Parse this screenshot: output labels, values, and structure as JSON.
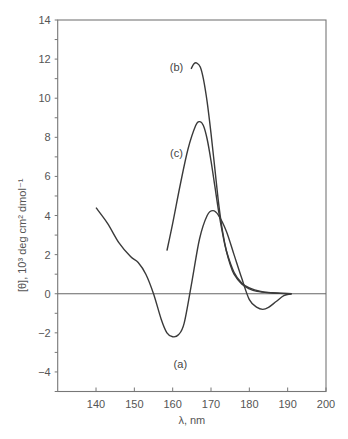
{
  "chart_data": {
    "type": "line",
    "title": "",
    "xlabel": "λ, nm",
    "ylabel": "[θ], 10³ deg cm² dmol⁻¹",
    "xlim": [
      130,
      200
    ],
    "ylim": [
      -5,
      14
    ],
    "x_ticks": [
      140,
      150,
      160,
      170,
      180,
      190,
      200
    ],
    "y_ticks": [
      -4,
      -2,
      0,
      2,
      4,
      6,
      8,
      10,
      12,
      14
    ],
    "grid": false,
    "legend": "inline curve labels",
    "zero_line": true,
    "series": [
      {
        "name": "(a)",
        "x": [
          140,
          143,
          146,
          149,
          151,
          153,
          155,
          157,
          158.5,
          160,
          161.5,
          163,
          165,
          167,
          169,
          170.5,
          172,
          174,
          176,
          178,
          180,
          182,
          183.5,
          185,
          187,
          189,
          191
        ],
        "y": [
          4.4,
          3.6,
          2.6,
          1.9,
          1.6,
          1.0,
          0.0,
          -1.3,
          -2.0,
          -2.2,
          -2.1,
          -1.5,
          0.6,
          2.8,
          4.0,
          4.25,
          4.0,
          3.2,
          2.0,
          0.8,
          -0.3,
          -0.7,
          -0.8,
          -0.7,
          -0.4,
          -0.1,
          0.0
        ]
      },
      {
        "name": "(b)",
        "x": [
          164.8,
          165.5,
          166.3,
          167.2,
          168,
          169,
          170,
          171,
          172,
          173,
          174,
          175,
          176,
          178,
          180,
          182,
          185,
          188,
          191
        ],
        "y": [
          11.5,
          11.75,
          11.8,
          11.6,
          11.0,
          9.8,
          8.2,
          6.4,
          4.6,
          3.2,
          2.2,
          1.5,
          1.0,
          0.5,
          0.25,
          0.12,
          0.05,
          0.02,
          0.0
        ]
      },
      {
        "name": "(c)",
        "x": [
          158.5,
          160,
          162,
          164,
          166,
          167,
          168,
          169,
          170,
          171,
          172,
          173,
          174,
          176,
          178,
          180,
          183,
          186,
          189,
          191
        ],
        "y": [
          2.2,
          3.6,
          5.6,
          7.4,
          8.6,
          8.8,
          8.6,
          7.9,
          6.8,
          5.5,
          4.2,
          3.1,
          2.2,
          1.1,
          0.55,
          0.3,
          0.12,
          0.05,
          0.02,
          0.0
        ]
      }
    ],
    "annotations": [
      {
        "text": "(a)",
        "x": 162,
        "y": -3.6
      },
      {
        "text": "(b)",
        "x": 161,
        "y": 11.6
      },
      {
        "text": "(c)",
        "x": 161,
        "y": 7.2
      }
    ]
  },
  "colors": {
    "axis": "#777777",
    "curve": "#3a3a3a",
    "text": "#555555"
  }
}
